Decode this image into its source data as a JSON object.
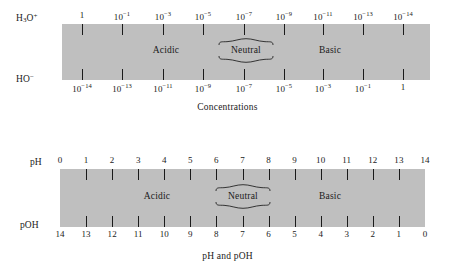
{
  "figures": [
    {
      "id": "concentrations",
      "caption": "Concentrations",
      "top_row_label": "H3O+",
      "bottom_row_label": "HO-",
      "top_tick_labels": [
        "1",
        "10-1",
        "10-3",
        "10-5",
        "10-7",
        "10-9",
        "10-11",
        "10-13",
        "10-14"
      ],
      "bottom_tick_labels": [
        "10-14",
        "10-13",
        "10-11",
        "10-9",
        "10-7",
        "10-5",
        "10-3",
        "10-1",
        "1"
      ],
      "regions": {
        "acidic": "Acidic",
        "neutral": "Neutral",
        "basic": "Basic"
      }
    },
    {
      "id": "ph",
      "caption": "pH and pOH",
      "top_row_label": "pH",
      "bottom_row_label": "pOH",
      "top_tick_labels": [
        "0",
        "1",
        "2",
        "3",
        "4",
        "5",
        "6",
        "7",
        "8",
        "9",
        "10",
        "11",
        "12",
        "13",
        "14"
      ],
      "bottom_tick_labels": [
        "14",
        "13",
        "12",
        "11",
        "10",
        "9",
        "8",
        "7",
        "6",
        "5",
        "4",
        "3",
        "2",
        "1",
        "0"
      ],
      "regions": {
        "acidic": "Acidic",
        "neutral": "Neutral",
        "basic": "Basic"
      }
    }
  ],
  "colors": {
    "band": "#bfbfbf",
    "ink": "#1a1a1a",
    "background": "#ffffff"
  }
}
